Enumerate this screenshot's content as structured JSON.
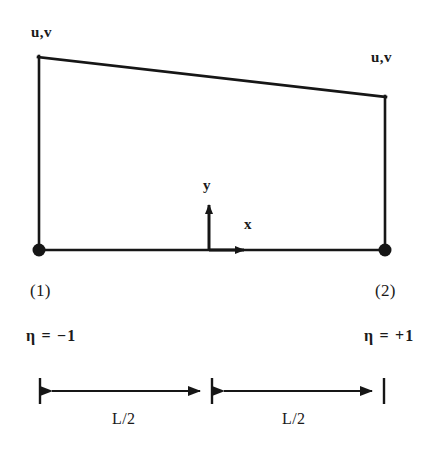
{
  "figure": {
    "canvas": {
      "width": 443,
      "height": 452
    },
    "colors": {
      "background": "#ffffff",
      "stroke": "#161616",
      "text": "#1a1a1a"
    }
  },
  "dof_labels": {
    "left": "u,v",
    "right": "u,v"
  },
  "axes": {
    "y_label": "y",
    "x_label": "x",
    "origin_note": "element midpoint"
  },
  "nodes": [
    {
      "id": "1",
      "label": "(1)",
      "eta": "η = −1",
      "position": "left"
    },
    {
      "id": "2",
      "label": "(2)",
      "eta": "η = +1",
      "position": "right"
    }
  ],
  "eta_labels": {
    "left": "η = −1",
    "right": "η = +1"
  },
  "dimensions": [
    {
      "label": "L/2",
      "side": "left"
    },
    {
      "label": "L/2",
      "side": "right"
    }
  ],
  "geometry": {
    "top_left": {
      "x": 38,
      "y": 56
    },
    "top_right": {
      "x": 386,
      "y": 96
    },
    "bottom_left": {
      "x": 38,
      "y": 250
    },
    "bottom_right": {
      "x": 386,
      "y": 250
    },
    "node_dot_radius": 6,
    "y_axis_top": 198,
    "x_axis_tip": 252,
    "origin_x": 209,
    "dim_line_y": 391,
    "dim_tick_left": 40,
    "dim_tick_mid": 212,
    "dim_tick_right": 385
  }
}
